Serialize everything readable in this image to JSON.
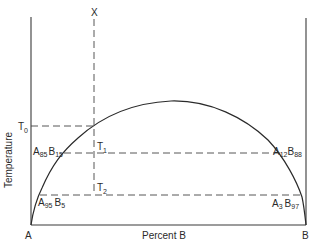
{
  "diagram": {
    "type": "phase-diagram (miscibility gap / solvus)",
    "y_axis_label": "Temperature",
    "x_axis_label": "Percent B",
    "left_endpoint": "A",
    "right_endpoint": "B",
    "composition_line_label": "X",
    "temperatures": {
      "t0": {
        "base": "T",
        "sub": "0"
      },
      "t1": {
        "base": "T",
        "sub": "1"
      },
      "t2": {
        "base": "T",
        "sub": "2"
      }
    },
    "compositions": {
      "t1_left": {
        "a": "A",
        "a_sub": "85",
        "b": "B",
        "b_sub": "15"
      },
      "t1_right": {
        "a": "A",
        "a_sub": "12",
        "b": "B",
        "b_sub": "88"
      },
      "t2_left": {
        "a": "A",
        "a_sub": "95",
        "b": "B",
        "b_sub": "5"
      },
      "t2_right": {
        "a": "A",
        "a_sub": "3",
        "b": "B",
        "b_sub": "97"
      }
    },
    "colors": {
      "line": "#2a2a2a",
      "background": "#ffffff"
    }
  }
}
